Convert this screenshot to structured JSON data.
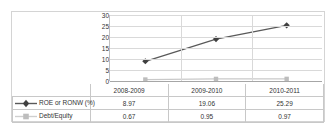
{
  "chart_data": {
    "type": "line",
    "title": "",
    "xlabel": "",
    "ylabel": "",
    "categories": [
      "2008-2009",
      "2009-2010",
      "2010-2011"
    ],
    "series": [
      {
        "name": "ROE or RONW (%)",
        "values": [
          8.97,
          19.06,
          25.29
        ],
        "color": "#595959",
        "marker": "diamond",
        "marker_color": "#404040"
      },
      {
        "name": "Debt/Equity",
        "values": [
          0.67,
          0.95,
          0.97
        ],
        "color": "#c9c9c9",
        "marker": "square",
        "marker_color": "#bdbdbd"
      }
    ],
    "ylim": [
      0,
      30
    ],
    "yticks": [
      0,
      5,
      10,
      15,
      20,
      25,
      30
    ],
    "ytick_labels": [
      "0",
      "5",
      "10",
      "15",
      "20",
      "25",
      "30"
    ],
    "grid": true,
    "legend_position": "data-table-left"
  },
  "table": {
    "column_headers": [
      "2008-2009",
      "2009-2010",
      "2010-2011"
    ],
    "rows": [
      {
        "label": "ROE or RONW (%)",
        "marker": "diamond",
        "values": [
          "8.97",
          "19.06",
          "25.29"
        ]
      },
      {
        "label": "Debt/Equity",
        "marker": "square",
        "values": [
          "0.67",
          "0.95",
          "0.97"
        ]
      }
    ]
  },
  "colors": {
    "series_primary": "#595959",
    "series_secondary": "#c9c9c9",
    "gridline": "#d9d9d9",
    "axis": "#a6a6a6",
    "border": "#d4d4d4",
    "text": "#333333"
  }
}
